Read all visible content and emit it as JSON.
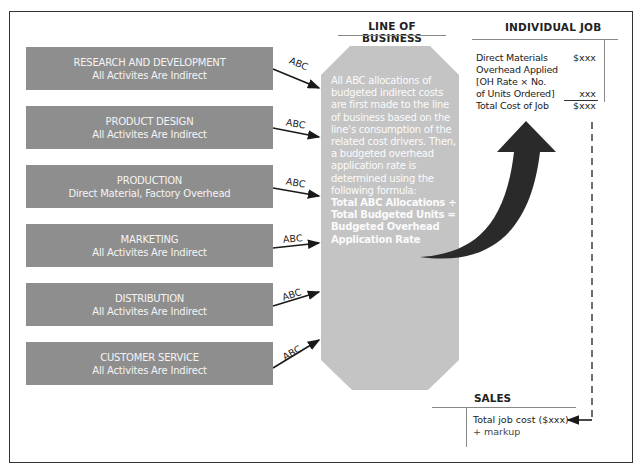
{
  "departments": [
    {
      "title": "RESEARCH AND DEVELOPMENT",
      "subtitle": "All Activites Are Indirect",
      "arrow_label": "ABC"
    },
    {
      "title": "PRODUCT DESIGN",
      "subtitle": "All Activites Are Indirect",
      "arrow_label": "ABC"
    },
    {
      "title": "PRODUCTION",
      "subtitle": "Direct Material, Factory Overhead",
      "arrow_label": "ABC"
    },
    {
      "title": "MARKETING",
      "subtitle": "All Activites Are Indirect",
      "arrow_label": "ABC"
    },
    {
      "title": "DISTRIBUTION",
      "subtitle": "All Activites Are Indirect",
      "arrow_label": "ABC"
    },
    {
      "title": "CUSTOMER SERVICE",
      "subtitle": "All Activites Are Indirect",
      "arrow_label": "ABC"
    }
  ],
  "line_of_business": {
    "title": "LINE OF BUSINESS",
    "description": "All ABC allocations of budgeted indirect costs are first made to the line of business based on the line’s consumption of the related cost drivers. Then, a budgeted overhead application rate is determined using the following formula:",
    "formula": [
      "Total ABC Allocations ÷",
      "Total Budgeted Units =",
      "Budgeted Overhead",
      "Application Rate"
    ]
  },
  "individual_job": {
    "title": "INDIVIDUAL JOB",
    "rows": [
      {
        "label": "Direct Materials",
        "amount": "$xxx"
      },
      {
        "label": "Overhead Applied",
        "amount": ""
      },
      {
        "label": "[OH Rate × No.",
        "amount": ""
      },
      {
        "label": "of Units Ordered]",
        "amount": "xxx"
      },
      {
        "label": "Total Cost of Job",
        "amount": "$xxx"
      }
    ]
  },
  "sales": {
    "title": "SALES",
    "lines": [
      "Total job cost ($xxx)",
      "+ markup"
    ]
  },
  "colors": {
    "department_box": "#8e8e8e",
    "line_of_business_box": "#c4c4c4",
    "arrow": "#2a2a2a"
  }
}
